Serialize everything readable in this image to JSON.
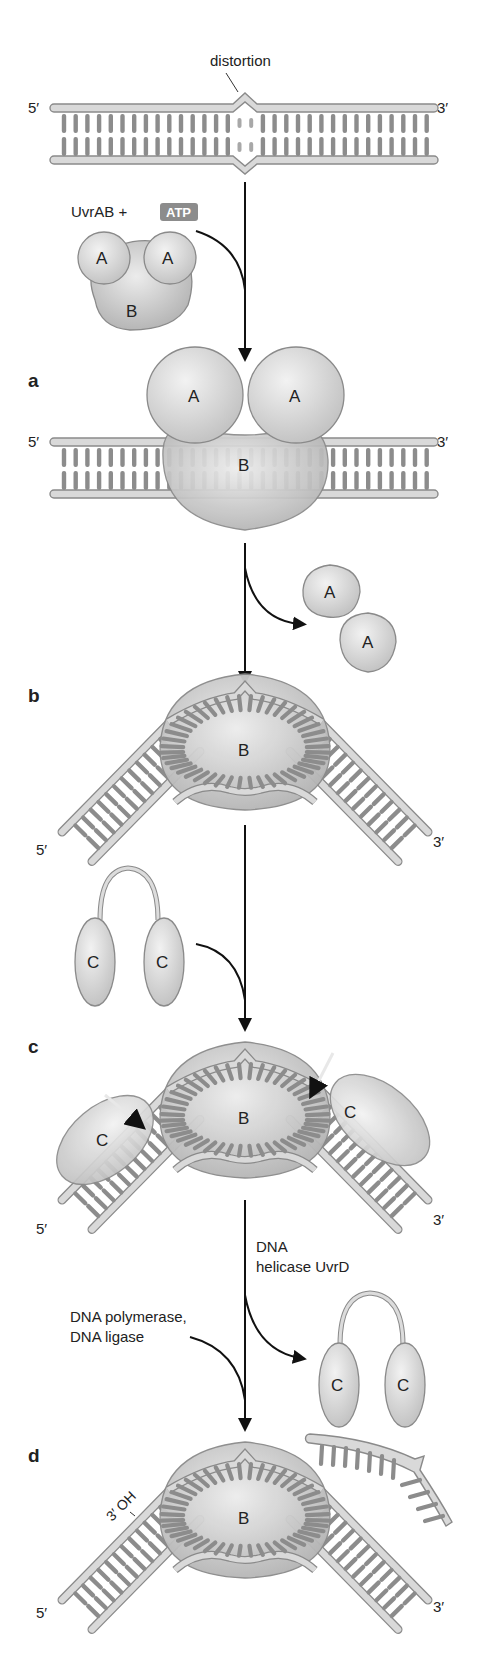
{
  "diagram": {
    "colors": {
      "protein_A": "#cfcfcf",
      "protein_B": "#bdbdbd",
      "protein_C": "#c8c8c8",
      "strand": "#d9d9d9",
      "base": "#8c8c8c",
      "arrow": "#111111",
      "atp_box": "#8c8c8c"
    },
    "top": {
      "distortion_label": "distortion",
      "end5": "5′",
      "end3": "3′",
      "reagent": "UvrAB +",
      "atp": "ATP",
      "complex": {
        "A1": "A",
        "A2": "A",
        "B": "B"
      }
    },
    "panels": [
      {
        "id": "a",
        "label": "a",
        "end5": "5′",
        "end3": "3′",
        "proteins": [
          "A",
          "A",
          "B"
        ]
      },
      {
        "id": "b",
        "label": "b",
        "end5": "5′",
        "end3": "3′",
        "proteins": [
          "B"
        ],
        "released": [
          "A",
          "A"
        ]
      },
      {
        "id": "c",
        "label": "c",
        "end5": "5′",
        "end3": "3′",
        "proteins": [
          "C",
          "B",
          "C"
        ],
        "incoming": [
          "C",
          "C"
        ]
      },
      {
        "id": "d",
        "label": "d",
        "end5": "5′",
        "end3": "3′",
        "proteins": [
          "B"
        ],
        "oh_label": "3′ OH",
        "released": [
          "C",
          "C"
        ]
      }
    ],
    "steps": {
      "helicase_label_1": "DNA",
      "helicase_label_2": "helicase UvrD",
      "polymerase_label_1": "DNA polymerase,",
      "polymerase_label_2": "DNA ligase"
    }
  }
}
